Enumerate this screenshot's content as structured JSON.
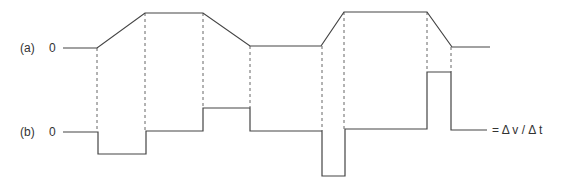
{
  "rows": {
    "a": {
      "label": "(a)",
      "zero": "0"
    },
    "b": {
      "label": "(b)",
      "zero": "0"
    }
  },
  "equation": "= Δ v / Δ t",
  "colors": {
    "line": "#444444",
    "dash": "#555555"
  },
  "waveform_a": [
    [
      63,
      48
    ],
    [
      97,
      48
    ],
    [
      145,
      13
    ],
    [
      203,
      13
    ],
    [
      250,
      46
    ],
    [
      321,
      46
    ],
    [
      344,
      12
    ],
    [
      427,
      12
    ],
    [
      452,
      47
    ],
    [
      490,
      47
    ]
  ],
  "waveform_b": [
    [
      63,
      132
    ],
    [
      98,
      132
    ],
    [
      98,
      154
    ],
    [
      146,
      154
    ],
    [
      146,
      131
    ],
    [
      203,
      131
    ],
    [
      203,
      108
    ],
    [
      250,
      108
    ],
    [
      250,
      131
    ],
    [
      322,
      131
    ],
    [
      322,
      176
    ],
    [
      345,
      176
    ],
    [
      345,
      129
    ],
    [
      427,
      129
    ],
    [
      427,
      72
    ],
    [
      451,
      72
    ],
    [
      451,
      130
    ],
    [
      487,
      130
    ]
  ],
  "dashed_x": [
    97,
    145,
    203,
    250,
    322,
    344,
    427,
    451
  ]
}
